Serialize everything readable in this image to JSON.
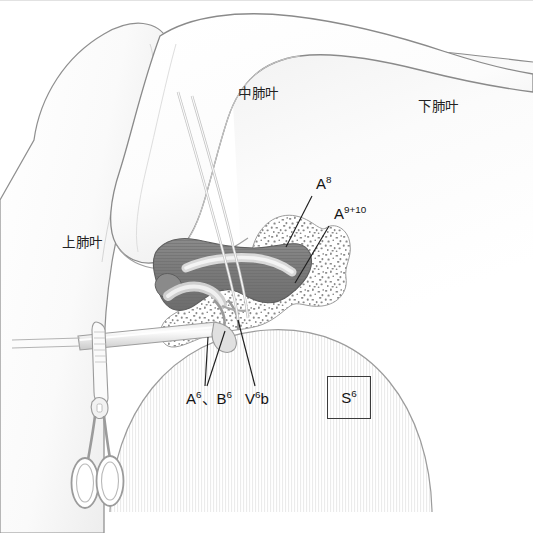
{
  "figure": {
    "background_color": "#ffffff",
    "width": 533,
    "height": 533
  },
  "labels": {
    "upper_lobe": "上肺叶",
    "middle_lobe": "中肺叶",
    "lower_lobe": "下肺叶",
    "a8": "A",
    "a8_sup": "8",
    "a9_10": "A",
    "a9_10_sup": "9+10",
    "a6_b6_part1": "A",
    "a6_b6_sup1": "6",
    "a6_b6_sep": "、B",
    "a6_b6_sup2": "6",
    "v6b_main": "V",
    "v6b_sup": "6",
    "v6b_tail": "b",
    "s6_main": "S",
    "s6_sup": "6"
  },
  "colors": {
    "vessel_dark": "#7c7c7c",
    "vessel_dark_edge": "#5d5d5d",
    "vessel_light": "#d8d8d8",
    "lymph_stipple": "#8c8c8c",
    "lung_outline": "#8a8a8a",
    "lung_fill": "#fbfbfb",
    "lung_shadow": "#e6e6e6",
    "instrument_outline": "#9a9a9a",
    "hatch_line": "#cfcfcf",
    "leader_line": "#1f1f1f",
    "text": "#1c1c1c",
    "box_border": "#3b3b3b"
  },
  "annotations": {
    "leader_lines": [
      {
        "name": "a8-leader",
        "x1": 312,
        "y1": 196,
        "x2": 286,
        "y2": 247
      },
      {
        "name": "a9-10-leader",
        "x1": 329,
        "y1": 226,
        "x2": 295,
        "y2": 283
      },
      {
        "name": "a6-b6-leader-left",
        "x1": 205,
        "y1": 386,
        "x2": 208,
        "y2": 337
      },
      {
        "name": "a6-b6-leader-right",
        "x1": 207,
        "y1": 386,
        "x2": 225,
        "y2": 331
      },
      {
        "name": "v6b-leader",
        "x1": 255,
        "y1": 386,
        "x2": 238,
        "y2": 320
      }
    ]
  },
  "structures": {
    "upper_lobe": "Right upper lobe, smooth rounded mass at upper-left",
    "middle_lobe": "Right middle lobe, large curved lobe across top",
    "lower_lobe": "Right lower lobe, visible at upper-right",
    "s6_segment": "S6 superior segment, vertically hatched dome at lower-right",
    "vessel_mass": "Dark pulmonary artery trunk with branches",
    "lymph_node": "Stippled lymph node / fatty tissue surrounding vessels",
    "retraction_tapes": "Two thin tapes passing behind the artery",
    "forceps": "Surgical forceps with ring handles at lower-left",
    "dissector": "Horizontal dissector / grasper shaft entering from left"
  }
}
